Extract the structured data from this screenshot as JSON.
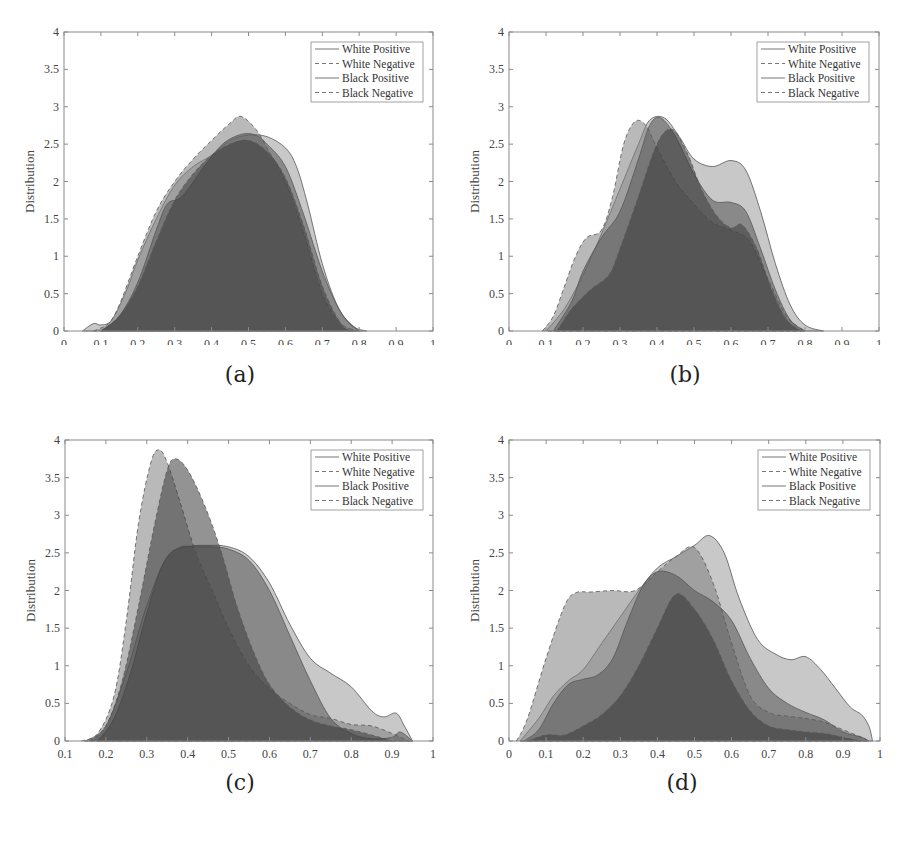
{
  "figure": {
    "panels": [
      {
        "id": "a",
        "caption": "(a)"
      },
      {
        "id": "b",
        "caption": "(b)"
      },
      {
        "id": "c",
        "caption": "(c)"
      },
      {
        "id": "d",
        "caption": "(d)"
      }
    ]
  },
  "chart_data": [
    {
      "type": "area",
      "panel": "(a)",
      "title": "",
      "xlabel": "Score",
      "ylabel": "Distribution",
      "xlim": [
        0,
        1
      ],
      "ylim": [
        0,
        4
      ],
      "xticks": [
        "0",
        "0.1",
        "0.2",
        "0.3",
        "0.4",
        "0.5",
        "0.6",
        "0.7",
        "0.8",
        "0.9",
        "1"
      ],
      "yticks": [
        "0",
        "0.5",
        "1",
        "1.5",
        "2",
        "2.5",
        "3",
        "3.5",
        "4"
      ],
      "legend": [
        "White Positive",
        "White Negative",
        "Black Positive",
        "Black Negative"
      ],
      "legend_position": "upper right",
      "grid": false,
      "series": [
        {
          "name": "White Positive",
          "style": "solid",
          "x": [
            0.05,
            0.08,
            0.1,
            0.13,
            0.17,
            0.2,
            0.25,
            0.3,
            0.35,
            0.4,
            0.45,
            0.5,
            0.55,
            0.6,
            0.63,
            0.66,
            0.7,
            0.74,
            0.78,
            0.82
          ],
          "y": [
            0,
            0.1,
            0.08,
            0.15,
            0.55,
            0.95,
            1.5,
            1.95,
            2.2,
            2.35,
            2.55,
            2.62,
            2.6,
            2.45,
            2.2,
            1.7,
            0.9,
            0.35,
            0.07,
            0
          ]
        },
        {
          "name": "White Negative",
          "style": "dashed",
          "x": [
            0.08,
            0.12,
            0.15,
            0.2,
            0.25,
            0.3,
            0.35,
            0.4,
            0.45,
            0.48,
            0.52,
            0.55,
            0.6,
            0.65,
            0.7,
            0.75,
            0.8
          ],
          "y": [
            0,
            0.1,
            0.35,
            1.0,
            1.6,
            2.0,
            2.3,
            2.55,
            2.78,
            2.87,
            2.7,
            2.45,
            2.0,
            1.3,
            0.5,
            0.1,
            0
          ]
        },
        {
          "name": "Black Positive",
          "style": "solid",
          "x": [
            0.1,
            0.15,
            0.2,
            0.25,
            0.28,
            0.32,
            0.38,
            0.43,
            0.48,
            0.52,
            0.55,
            0.6,
            0.65,
            0.7,
            0.75,
            0.8
          ],
          "y": [
            0,
            0.2,
            0.65,
            1.35,
            1.7,
            1.8,
            2.2,
            2.5,
            2.63,
            2.62,
            2.5,
            2.2,
            1.55,
            0.8,
            0.25,
            0
          ]
        },
        {
          "name": "Black Negative",
          "style": "dashed",
          "x": [
            0.1,
            0.15,
            0.2,
            0.25,
            0.3,
            0.35,
            0.4,
            0.45,
            0.5,
            0.55,
            0.6,
            0.65,
            0.7,
            0.75,
            0.78
          ],
          "y": [
            0,
            0.2,
            0.6,
            1.2,
            1.75,
            2.1,
            2.35,
            2.5,
            2.55,
            2.4,
            2.05,
            1.4,
            0.6,
            0.1,
            0
          ]
        }
      ]
    },
    {
      "type": "area",
      "panel": "(b)",
      "title": "",
      "xlabel": "Score",
      "ylabel": "Distribution",
      "xlim": [
        0,
        1
      ],
      "ylim": [
        0,
        4
      ],
      "xticks": [
        "0",
        "0.1",
        "0.2",
        "0.3",
        "0.4",
        "0.5",
        "0.6",
        "0.7",
        "0.8",
        "0.9",
        "1"
      ],
      "yticks": [
        "0",
        "0.5",
        "1",
        "1.5",
        "2",
        "2.5",
        "3",
        "3.5",
        "4"
      ],
      "legend": [
        "White Positive",
        "White Negative",
        "Black Positive",
        "Black Negative"
      ],
      "legend_position": "upper right",
      "grid": false,
      "series": [
        {
          "name": "White Positive",
          "style": "solid",
          "x": [
            0.1,
            0.15,
            0.2,
            0.25,
            0.3,
            0.35,
            0.38,
            0.42,
            0.46,
            0.5,
            0.55,
            0.6,
            0.64,
            0.68,
            0.72,
            0.76,
            0.8,
            0.85
          ],
          "y": [
            0,
            0.3,
            0.75,
            1.3,
            1.9,
            2.5,
            2.82,
            2.85,
            2.6,
            2.3,
            2.2,
            2.28,
            2.15,
            1.6,
            0.9,
            0.35,
            0.08,
            0
          ]
        },
        {
          "name": "White Negative",
          "style": "dashed",
          "x": [
            0.09,
            0.12,
            0.15,
            0.18,
            0.21,
            0.25,
            0.28,
            0.31,
            0.34,
            0.37,
            0.4,
            0.45,
            0.5,
            0.55,
            0.6,
            0.65,
            0.7,
            0.75,
            0.8
          ],
          "y": [
            0,
            0.2,
            0.6,
            1.0,
            1.25,
            1.35,
            1.8,
            2.5,
            2.8,
            2.75,
            2.45,
            2.0,
            1.7,
            1.45,
            1.35,
            1.2,
            0.7,
            0.2,
            0
          ]
        },
        {
          "name": "Black Positive",
          "style": "solid",
          "x": [
            0.12,
            0.17,
            0.2,
            0.25,
            0.3,
            0.35,
            0.38,
            0.41,
            0.45,
            0.5,
            0.55,
            0.6,
            0.64,
            0.68,
            0.72,
            0.76,
            0.8
          ],
          "y": [
            0,
            0.4,
            0.8,
            1.25,
            1.6,
            2.3,
            2.75,
            2.85,
            2.6,
            2.1,
            1.75,
            1.72,
            1.6,
            1.1,
            0.55,
            0.15,
            0
          ]
        },
        {
          "name": "Black Negative",
          "style": "dashed",
          "x": [
            0.13,
            0.17,
            0.22,
            0.27,
            0.3,
            0.35,
            0.4,
            0.44,
            0.48,
            0.52,
            0.56,
            0.6,
            0.63,
            0.67,
            0.71,
            0.75,
            0.79
          ],
          "y": [
            0,
            0.3,
            0.55,
            0.75,
            1.1,
            1.8,
            2.5,
            2.7,
            2.4,
            1.9,
            1.55,
            1.38,
            1.42,
            1.1,
            0.55,
            0.15,
            0
          ]
        }
      ]
    },
    {
      "type": "area",
      "panel": "(c)",
      "title": "",
      "xlabel": "Score",
      "ylabel": "Distribution",
      "xlim": [
        0.1,
        1
      ],
      "ylim": [
        0,
        4
      ],
      "xticks": [
        "0.1",
        "0.2",
        "0.3",
        "0.4",
        "0.5",
        "0.6",
        "0.7",
        "0.8",
        "0.9",
        "1"
      ],
      "yticks": [
        "0",
        "0.5",
        "1",
        "1.5",
        "2",
        "2.5",
        "3",
        "3.5",
        "4"
      ],
      "legend": [
        "White Positive",
        "White Negative",
        "Black Positive",
        "Black Negative"
      ],
      "legend_position": "upper right",
      "grid": false,
      "series": [
        {
          "name": "White Positive",
          "style": "solid",
          "x": [
            0.15,
            0.2,
            0.25,
            0.3,
            0.35,
            0.4,
            0.45,
            0.5,
            0.55,
            0.6,
            0.65,
            0.7,
            0.75,
            0.8,
            0.85,
            0.88,
            0.91,
            0.93,
            0.95
          ],
          "y": [
            0,
            0.2,
            0.9,
            1.8,
            2.45,
            2.58,
            2.6,
            2.58,
            2.45,
            2.1,
            1.55,
            1.1,
            0.9,
            0.72,
            0.4,
            0.32,
            0.37,
            0.2,
            0
          ]
        },
        {
          "name": "White Negative",
          "style": "dashed",
          "x": [
            0.14,
            0.18,
            0.22,
            0.25,
            0.28,
            0.31,
            0.33,
            0.35,
            0.38,
            0.42,
            0.46,
            0.5,
            0.55,
            0.6,
            0.65,
            0.7,
            0.75,
            0.8,
            0.85,
            0.9,
            0.94
          ],
          "y": [
            0,
            0.1,
            0.6,
            1.6,
            2.9,
            3.7,
            3.87,
            3.7,
            3.2,
            2.5,
            2.0,
            1.5,
            1.0,
            0.7,
            0.5,
            0.35,
            0.3,
            0.22,
            0.2,
            0.1,
            0
          ]
        },
        {
          "name": "Black Positive",
          "style": "solid",
          "x": [
            0.18,
            0.22,
            0.26,
            0.3,
            0.34,
            0.38,
            0.42,
            0.46,
            0.5,
            0.55,
            0.6,
            0.65,
            0.7,
            0.75,
            0.8,
            0.85,
            0.9,
            0.92,
            0.95
          ],
          "y": [
            0,
            0.3,
            0.9,
            1.7,
            2.35,
            2.57,
            2.58,
            2.58,
            2.55,
            2.4,
            2.0,
            1.4,
            0.8,
            0.3,
            0.1,
            0.03,
            0.05,
            0.12,
            0
          ]
        },
        {
          "name": "Black Negative",
          "style": "dashed",
          "x": [
            0.16,
            0.2,
            0.24,
            0.28,
            0.32,
            0.35,
            0.37,
            0.4,
            0.44,
            0.48,
            0.52,
            0.56,
            0.6,
            0.65,
            0.7,
            0.75,
            0.8,
            0.85,
            0.9
          ],
          "y": [
            0,
            0.2,
            0.8,
            1.8,
            2.9,
            3.6,
            3.75,
            3.6,
            3.15,
            2.55,
            1.8,
            1.2,
            0.75,
            0.45,
            0.28,
            0.2,
            0.15,
            0.08,
            0
          ]
        }
      ]
    },
    {
      "type": "area",
      "panel": "(d)",
      "title": "",
      "xlabel": "Score",
      "ylabel": "Distribution",
      "xlim": [
        0,
        1
      ],
      "ylim": [
        0,
        4
      ],
      "xticks": [
        "0",
        "0.1",
        "0.2",
        "0.3",
        "0.4",
        "0.5",
        "0.6",
        "0.7",
        "0.8",
        "0.9",
        "1"
      ],
      "yticks": [
        "0",
        "0.5",
        "1",
        "1.5",
        "2",
        "2.5",
        "3",
        "3.5",
        "4"
      ],
      "legend": [
        "White Positive",
        "White Negative",
        "Black Positive",
        "Black Negative"
      ],
      "legend_position": "upper right",
      "grid": false,
      "series": [
        {
          "name": "White Positive",
          "style": "solid",
          "x": [
            0.03,
            0.08,
            0.12,
            0.16,
            0.2,
            0.25,
            0.3,
            0.35,
            0.4,
            0.45,
            0.5,
            0.54,
            0.58,
            0.62,
            0.67,
            0.72,
            0.76,
            0.8,
            0.84,
            0.88,
            0.92,
            0.95,
            0.97,
            0.98
          ],
          "y": [
            0,
            0.3,
            0.6,
            0.8,
            0.95,
            1.3,
            1.65,
            2.0,
            2.3,
            2.45,
            2.6,
            2.73,
            2.5,
            1.9,
            1.35,
            1.15,
            1.08,
            1.12,
            0.95,
            0.7,
            0.45,
            0.35,
            0.2,
            0
          ]
        },
        {
          "name": "White Negative",
          "style": "dashed",
          "x": [
            0.02,
            0.05,
            0.1,
            0.15,
            0.18,
            0.22,
            0.28,
            0.34,
            0.4,
            0.45,
            0.5,
            0.55,
            0.6,
            0.65,
            0.7,
            0.75,
            0.8,
            0.85,
            0.9,
            0.95,
            0.97
          ],
          "y": [
            0,
            0.3,
            1.1,
            1.8,
            1.97,
            1.98,
            2.0,
            2.0,
            2.25,
            2.45,
            2.57,
            2.1,
            1.3,
            0.6,
            0.38,
            0.33,
            0.3,
            0.25,
            0.15,
            0.05,
            0
          ]
        },
        {
          "name": "Black Positive",
          "style": "solid",
          "x": [
            0.04,
            0.08,
            0.12,
            0.16,
            0.2,
            0.24,
            0.28,
            0.32,
            0.36,
            0.4,
            0.45,
            0.5,
            0.55,
            0.6,
            0.65,
            0.7,
            0.75,
            0.8,
            0.85,
            0.9,
            0.95,
            0.97
          ],
          "y": [
            0,
            0.15,
            0.5,
            0.75,
            0.82,
            0.88,
            1.1,
            1.6,
            2.05,
            2.25,
            2.2,
            2.0,
            1.85,
            1.6,
            1.1,
            0.7,
            0.5,
            0.38,
            0.28,
            0.12,
            0.05,
            0
          ]
        },
        {
          "name": "Black Negative",
          "style": "dashed",
          "x": [
            0.05,
            0.1,
            0.15,
            0.2,
            0.25,
            0.3,
            0.35,
            0.4,
            0.45,
            0.5,
            0.55,
            0.6,
            0.65,
            0.7,
            0.75,
            0.8,
            0.85,
            0.9,
            0.95
          ],
          "y": [
            0,
            0.08,
            0.08,
            0.2,
            0.35,
            0.6,
            1.0,
            1.5,
            1.95,
            1.75,
            1.35,
            0.8,
            0.4,
            0.2,
            0.15,
            0.12,
            0.1,
            0.05,
            0
          ]
        }
      ]
    }
  ],
  "style": {
    "fill_colors": [
      "#9a9a9a",
      "#7f7f7f",
      "#555555",
      "#3a3a3a"
    ],
    "fill_opacity": 0.55,
    "axis_color": "#8a8a8a",
    "text_color": "#444444"
  }
}
